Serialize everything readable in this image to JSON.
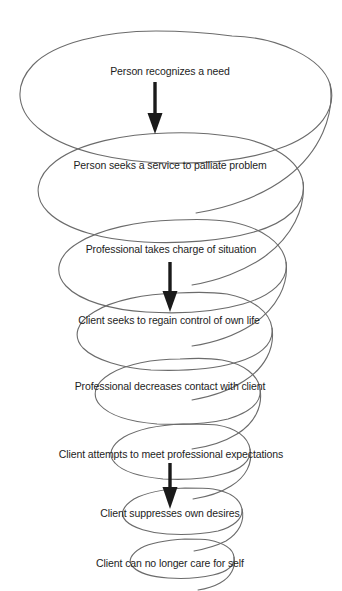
{
  "diagram": {
    "type": "conical-spiral-flow",
    "title": "",
    "canvas": {
      "width": 342,
      "height": 591
    },
    "colors": {
      "background": "#ffffff",
      "spiral_line": "#6b6b6b",
      "arrow": "#1a1a1a",
      "text": "#1d1d1d"
    },
    "stages": [
      {
        "id": "stage-1",
        "label": "Person recognizes a need",
        "x": 170,
        "y": 71
      },
      {
        "id": "stage-2",
        "label": "Person seeks a service to palliate problem",
        "x": 170,
        "y": 165
      },
      {
        "id": "stage-3",
        "label": "Professional takes charge of situation",
        "x": 171,
        "y": 249
      },
      {
        "id": "stage-4",
        "label": "Client seeks to regain control of own life",
        "x": 169,
        "y": 320
      },
      {
        "id": "stage-5",
        "label": "Professional decreases contact with client",
        "x": 170,
        "y": 386
      },
      {
        "id": "stage-6",
        "label": "Client attempts to meet professional expectations",
        "x": 171,
        "y": 454
      },
      {
        "id": "stage-7",
        "label": "Client suppresses own desires",
        "x": 170,
        "y": 513
      },
      {
        "id": "stage-8",
        "label": "Client can no longer care for self",
        "x": 170,
        "y": 563
      }
    ],
    "arrows": [
      {
        "id": "arrow-1",
        "from": "stage-1",
        "to": "stage-2",
        "x": 155,
        "y_start": 82,
        "y_end": 133
      },
      {
        "id": "arrow-2",
        "from": "stage-3",
        "to": "stage-4",
        "x": 170,
        "y_start": 262,
        "y_end": 311
      },
      {
        "id": "arrow-3",
        "from": "stage-6",
        "to": "stage-7",
        "x": 170,
        "y_start": 463,
        "y_end": 508
      }
    ]
  }
}
